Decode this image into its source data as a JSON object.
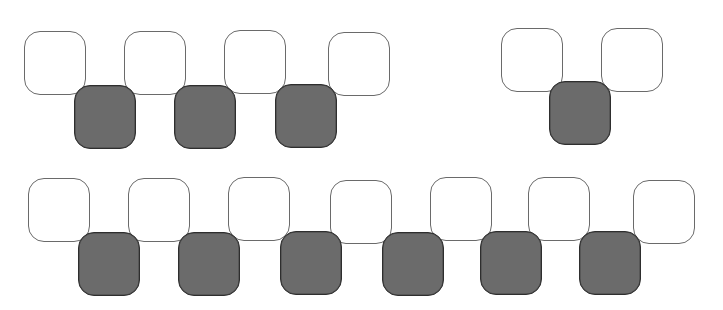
{
  "diagram": {
    "colors": {
      "light_fill": "#ffffff",
      "light_border": "#6a6a6a",
      "dark_fill": "#6b6b6b",
      "dark_border": "#2e2e2e"
    },
    "groups": [
      {
        "name": "top-left-group",
        "light_tiles": [
          {
            "x": 24,
            "y": 31
          },
          {
            "x": 124,
            "y": 31
          },
          {
            "x": 224,
            "y": 30
          },
          {
            "x": 328,
            "y": 32
          }
        ],
        "dark_tiles": [
          {
            "x": 74,
            "y": 85
          },
          {
            "x": 174,
            "y": 85
          },
          {
            "x": 275,
            "y": 84
          }
        ]
      },
      {
        "name": "top-right-group",
        "light_tiles": [
          {
            "x": 501,
            "y": 28
          },
          {
            "x": 601,
            "y": 28
          }
        ],
        "dark_tiles": [
          {
            "x": 549,
            "y": 81
          }
        ]
      },
      {
        "name": "bottom-group",
        "light_tiles": [
          {
            "x": 28,
            "y": 178
          },
          {
            "x": 128,
            "y": 178
          },
          {
            "x": 228,
            "y": 177
          },
          {
            "x": 330,
            "y": 180
          },
          {
            "x": 430,
            "y": 177
          },
          {
            "x": 528,
            "y": 177
          },
          {
            "x": 633,
            "y": 180
          }
        ],
        "dark_tiles": [
          {
            "x": 78,
            "y": 232
          },
          {
            "x": 178,
            "y": 232
          },
          {
            "x": 280,
            "y": 231
          },
          {
            "x": 382,
            "y": 232
          },
          {
            "x": 480,
            "y": 231
          },
          {
            "x": 579,
            "y": 231
          }
        ]
      }
    ],
    "counts": {
      "light_total": 13,
      "dark_total": 10
    }
  }
}
